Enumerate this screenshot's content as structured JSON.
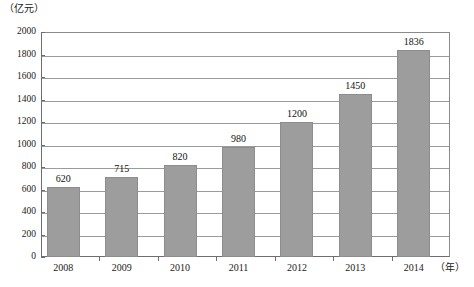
{
  "chart_data": {
    "type": "bar",
    "title": "",
    "subtitle": "",
    "xlabel": "（年）",
    "ylabel": "（亿元）",
    "categories": [
      "2008",
      "2009",
      "2010",
      "2011",
      "2012",
      "2013",
      "2014"
    ],
    "values": [
      620,
      715,
      820,
      980,
      1200,
      1450,
      1836
    ],
    "value_labels": [
      "620",
      "715",
      "820",
      "980",
      "1200",
      "1450",
      "1836"
    ],
    "ylim": [
      0,
      2000
    ],
    "ytick_step": 200,
    "yticks": [
      0,
      200,
      400,
      600,
      800,
      1000,
      1200,
      1400,
      1600,
      1800,
      2000
    ],
    "ytick_labels": [
      "0",
      "200",
      "400",
      "600",
      "800",
      "1000",
      "1200",
      "1400",
      "1600",
      "1800",
      "2000"
    ],
    "grid": true,
    "grid_axis": "y",
    "legend": false,
    "legend_position": "none",
    "series": [
      {
        "name": "",
        "values": [
          620,
          715,
          820,
          980,
          1200,
          1450,
          1836
        ]
      }
    ],
    "colors": {
      "bar_fill": "#9d9d9d",
      "bar_edge": "#8d8d8d",
      "gridline": "#9b9b9b",
      "axis": "#6e6e6e",
      "text": "#1a1a1a",
      "background": "#ffffff"
    }
  }
}
